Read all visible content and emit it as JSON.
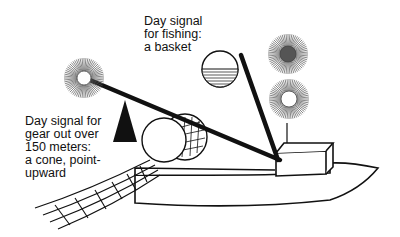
{
  "labels": {
    "basket": "Day signal\nfor fishing:\na basket",
    "cone": "Day signal for\ngear out over\n150 meters:\na cone, point-\nupward"
  },
  "figure": {
    "colors": {
      "ink": "#111111",
      "ray": "#555555",
      "fill_dark": "#555555",
      "background": "#ffffff"
    }
  }
}
